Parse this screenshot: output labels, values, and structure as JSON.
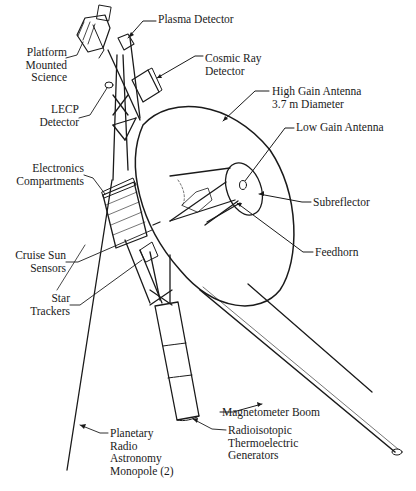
{
  "diagram": {
    "colors": {
      "ink": "#1a1a1a",
      "background": "#ffffff"
    },
    "labels": [
      {
        "id": "plasma_detector",
        "text": "Plasma Detector",
        "x": 158,
        "y": 20,
        "align": "left"
      },
      {
        "id": "platform_mounted_science",
        "text": "Platform\nMounted\nScience",
        "x": 0,
        "y": 52,
        "w": 67,
        "align": "right"
      },
      {
        "id": "cosmic_ray_detector",
        "text": "Cosmic Ray\nDetector",
        "x": 205,
        "y": 54,
        "align": "left"
      },
      {
        "id": "lecp_detector",
        "text": "LECP\nDetector",
        "x": 0,
        "y": 106,
        "w": 79,
        "align": "right"
      },
      {
        "id": "high_gain_antenna",
        "text": "High Gain Antenna\n3.7 m Diameter",
        "x": 271,
        "y": 85,
        "align": "left"
      },
      {
        "id": "low_gain_antenna",
        "text": "Low Gain Antenna",
        "x": 296,
        "y": 123,
        "align": "left"
      },
      {
        "id": "electronics_compartments",
        "text": "Electronics\nCompartments",
        "x": 0,
        "y": 167,
        "w": 84,
        "align": "right"
      },
      {
        "id": "subreflector",
        "text": "Subreflector",
        "x": 313,
        "y": 196,
        "align": "left"
      },
      {
        "id": "cruise_sun_sensors",
        "text": "Cruise Sun\nSensors",
        "x": 0,
        "y": 248,
        "w": 66,
        "align": "right"
      },
      {
        "id": "feedhorn",
        "text": "Feedhorn",
        "x": 315,
        "y": 246,
        "align": "left"
      },
      {
        "id": "star_trackers",
        "text": "Star\nTrackers",
        "x": 0,
        "y": 292,
        "w": 70,
        "align": "right"
      },
      {
        "id": "magnetometer_boom",
        "text": "Magnetometer Boom",
        "x": 222,
        "y": 407,
        "align": "left"
      },
      {
        "id": "rtg",
        "text": "Radioisotopic\nThermoelectric\nGenerators",
        "x": 228,
        "y": 424,
        "align": "left"
      },
      {
        "id": "pra_monopole",
        "text": "Planetary\nRadio\nAstronomy\nMonopole (2)",
        "x": 110,
        "y": 427,
        "align": "left"
      }
    ]
  }
}
